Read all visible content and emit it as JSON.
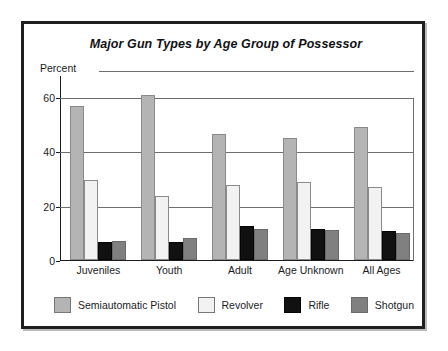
{
  "chart_data": {
    "type": "bar",
    "title": "Major Gun Types by Age Group of Possessor",
    "xlabel": "",
    "ylabel": "Percent",
    "ylim": [
      0,
      68
    ],
    "yticks": [
      0,
      20,
      40,
      60
    ],
    "ytick_labels": [
      "0",
      "20",
      "40",
      "60"
    ],
    "grid": true,
    "legend_position": "bottom",
    "categories": [
      "Juveniles",
      "Youth",
      "Adult",
      "Age Unknown",
      "All Ages"
    ],
    "series": [
      {
        "name": "Semiautomatic Pistol",
        "color": "#b4b4b4",
        "values": [
          56.5,
          60.5,
          46.5,
          45.0,
          49.0
        ]
      },
      {
        "name": "Revolver",
        "color": "#f2f2f2",
        "values": [
          29.5,
          23.5,
          27.5,
          28.5,
          27.0
        ]
      },
      {
        "name": "Rifle",
        "color": "#111111",
        "values": [
          6.5,
          6.5,
          12.5,
          11.5,
          10.5
        ]
      },
      {
        "name": "Shotgun",
        "color": "#808080",
        "values": [
          7.0,
          8.0,
          11.5,
          11.0,
          10.0
        ]
      }
    ]
  },
  "legend": {
    "items": [
      {
        "label": "Semiautomatic Pistol",
        "swatch": "semiauto"
      },
      {
        "label": "Revolver",
        "swatch": "revolver"
      },
      {
        "label": "Rifle",
        "swatch": "rifle"
      },
      {
        "label": "Shotgun",
        "swatch": "shotgun"
      }
    ]
  },
  "colors": {
    "frame": "#1f1f20",
    "axis": "#1b1c1e",
    "grid": "#6d6e70",
    "background": "#ffffff"
  }
}
